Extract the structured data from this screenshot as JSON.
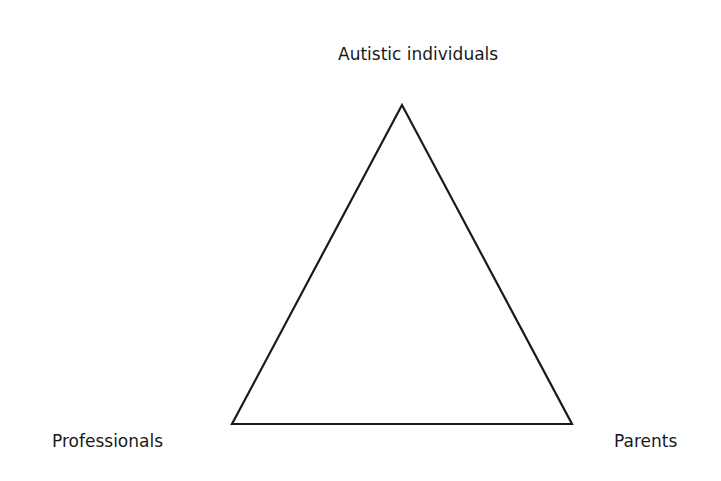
{
  "diagram": {
    "type": "triangle",
    "nodes": [
      {
        "id": "top",
        "label": "Autistic individuals"
      },
      {
        "id": "left",
        "label": "Professionals"
      },
      {
        "id": "right",
        "label": "Parents"
      }
    ],
    "stroke_color": "#1a1a1a"
  }
}
